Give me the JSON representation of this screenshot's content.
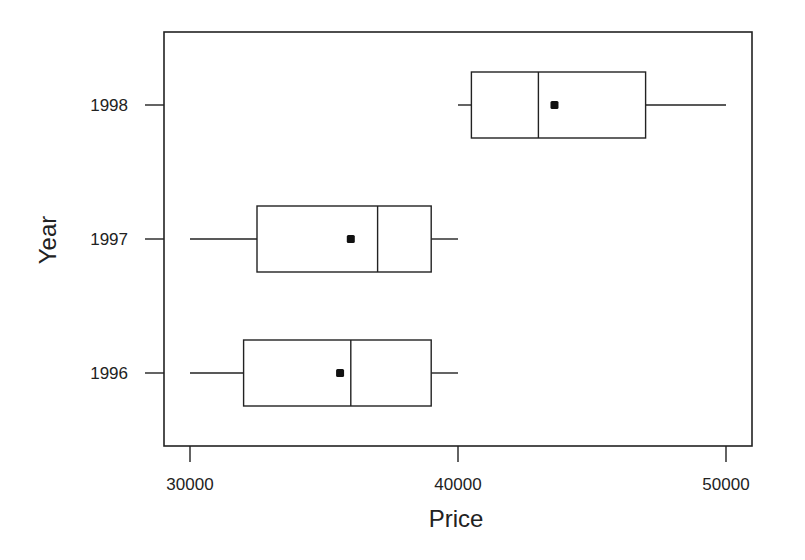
{
  "chart_data": {
    "type": "boxplot",
    "orientation": "horizontal",
    "title": "",
    "xlabel": "Price",
    "ylabel": "Year",
    "xlim": [
      29000,
      51000
    ],
    "x_ticks": [
      30000,
      40000,
      50000
    ],
    "x_tick_labels": [
      "30000",
      "40000",
      "50000"
    ],
    "categories": [
      "1996",
      "1997",
      "1998"
    ],
    "series": [
      {
        "name": "1996",
        "min": 30000,
        "q1": 32000,
        "median": 36000,
        "q3": 39000,
        "max": 40000,
        "mean": 35600
      },
      {
        "name": "1997",
        "min": 30000,
        "q1": 32500,
        "median": 37000,
        "q3": 39000,
        "max": 40000,
        "mean": 36000
      },
      {
        "name": "1998",
        "min": 40000,
        "q1": 40500,
        "median": 43000,
        "q3": 47000,
        "max": 50000,
        "mean": 43600
      }
    ],
    "grid": false,
    "legend": null,
    "colors": {
      "line": "#222222",
      "box_fill": "#ffffff",
      "mean_marker": "#111111"
    }
  }
}
